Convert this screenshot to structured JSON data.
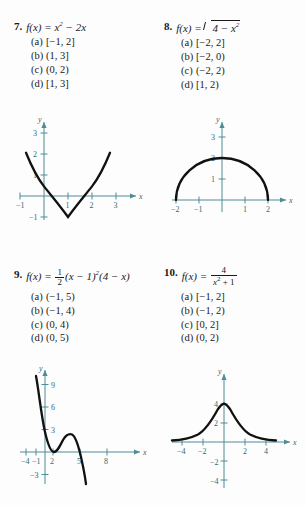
{
  "problems": [
    {
      "number": "7.",
      "fname": "f(x)",
      "equals": "=",
      "expr_plain": "x² − 2x",
      "choices": [
        {
          "label": "(a)",
          "value": "[−1, 2]"
        },
        {
          "label": "(b)",
          "value": "(1, 3]"
        },
        {
          "label": "(c)",
          "value": "(0, 2)"
        },
        {
          "label": "(d)",
          "value": "[1, 3]"
        }
      ],
      "graph": {
        "type": "line",
        "title": "",
        "xlabel": "x",
        "ylabel": "y",
        "xlim": [
          -1.6,
          3.6
        ],
        "ylim": [
          -1.6,
          3.6
        ],
        "xticks": [
          -1,
          1,
          2,
          3
        ],
        "yticks": [
          1,
          2,
          3,
          -1
        ],
        "xtick_labels": [
          "−1",
          "1",
          "2",
          "3"
        ],
        "ytick_labels": [
          "1",
          "2",
          "3",
          "−1"
        ],
        "function": "y = x^2 - 2x",
        "vertex": [
          1,
          -1
        ],
        "roots": [
          0,
          2
        ]
      }
    },
    {
      "number": "8.",
      "fname": "f(x)",
      "equals": "=",
      "expr_plain": "√(4 − x²)",
      "radicand_a": "4 −",
      "radicand_b": "x",
      "radicand_exp": "2",
      "choices": [
        {
          "label": "(a)",
          "value": "[−2, 2]"
        },
        {
          "label": "(b)",
          "value": "[−2, 0)"
        },
        {
          "label": "(c)",
          "value": "(−2, 2)"
        },
        {
          "label": "(d)",
          "value": "[1, 2)"
        }
      ],
      "graph": {
        "type": "line",
        "title": "",
        "xlabel": "x",
        "ylabel": "y",
        "xlim": [
          -2.6,
          2.6
        ],
        "ylim": [
          -0.7,
          3.7
        ],
        "xticks": [
          -2,
          -1,
          1,
          2
        ],
        "yticks": [
          1,
          2,
          3
        ],
        "xtick_labels": [
          "−2",
          "−1",
          "1",
          "2"
        ],
        "ytick_labels": [
          "1",
          "2",
          "3"
        ],
        "function": "y = sqrt(4 - x^2)",
        "domain": [
          -2,
          2
        ],
        "max": [
          0,
          2
        ]
      }
    },
    {
      "number": "9.",
      "fname": "f(x)",
      "equals": "=",
      "expr_plain": "½(x − 1)²(4 − x)",
      "frac_num": "1",
      "frac_den": "2",
      "expr_tail_a": "(x − 1)",
      "expr_tail_exp": "2",
      "expr_tail_b": "(4 − x)",
      "choices": [
        {
          "label": "(a)",
          "value": "(−1, 5)"
        },
        {
          "label": "(b)",
          "value": "(−1, 4)"
        },
        {
          "label": "(c)",
          "value": "(0, 4)"
        },
        {
          "label": "(d)",
          "value": "(0, 5)"
        }
      ],
      "graph": {
        "type": "line",
        "title": "",
        "xlabel": "x",
        "ylabel": "y",
        "xlim": [
          -5.5,
          9.5
        ],
        "ylim": [
          -4.5,
          11
        ],
        "xticks": [
          -4,
          -1,
          2,
          5,
          8
        ],
        "yticks": [
          3,
          6,
          9,
          -3
        ],
        "xtick_labels": [
          "−4",
          "−1",
          "2",
          "5",
          "8"
        ],
        "ytick_labels": [
          "3",
          "6",
          "9",
          "−3"
        ],
        "function": "y = 0.5(x-1)^2(4-x)",
        "local_min": [
          1,
          0
        ],
        "local_max": [
          3,
          2
        ],
        "root": [
          4,
          0
        ]
      }
    },
    {
      "number": "10.",
      "fname": "f(x)",
      "equals": "=",
      "expr_plain": "4/(x² + 1)",
      "frac_num": "4",
      "frac_den_a": "x",
      "frac_den_exp": "2",
      "frac_den_b": "+ 1",
      "choices": [
        {
          "label": "(a)",
          "value": "[−1, 2]"
        },
        {
          "label": "(b)",
          "value": "(−1, 2)"
        },
        {
          "label": "(c)",
          "value": "[0, 2]"
        },
        {
          "label": "(d)",
          "value": "(0, 2)"
        }
      ],
      "graph": {
        "type": "line",
        "title": "",
        "xlabel": "x",
        "ylabel": "y",
        "xlim": [
          -5.8,
          5.8
        ],
        "ylim": [
          -5,
          5.6
        ],
        "xticks": [
          -4,
          -2,
          2,
          4
        ],
        "yticks": [
          2,
          4,
          -2,
          -4
        ],
        "xtick_labels": [
          "−4",
          "−2",
          "2",
          "4"
        ],
        "ytick_labels": [
          "2",
          "4",
          "−2",
          "−4"
        ],
        "function": "y = 4/(x^2+1)",
        "max": [
          0,
          4
        ],
        "asymptote": "y = 0"
      }
    }
  ],
  "colors": {
    "axis": "#4e8c96",
    "curve": "#111111",
    "text": "#1a1a1a",
    "background": "#fdfdfd"
  }
}
